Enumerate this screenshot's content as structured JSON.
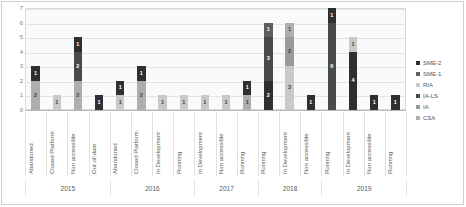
{
  "chart_data": {
    "type": "bar",
    "stacked": true,
    "title": "",
    "xlabel": "",
    "ylabel": "",
    "ylim": [
      0,
      7
    ],
    "yticks": [
      0,
      1,
      2,
      3,
      4,
      5,
      6,
      7
    ],
    "grid": true,
    "legend_position": "right",
    "series": [
      {
        "name": "SME-2",
        "color": "#2f2f2f"
      },
      {
        "name": "SME-1",
        "color": "#5e5e5e"
      },
      {
        "name": "RIA",
        "color": "#c9c9c9"
      },
      {
        "name": "IA-LS",
        "color": "#4a4a4a"
      },
      {
        "name": "IA",
        "color": "#9a9a9a"
      },
      {
        "name": "CSA",
        "color": "#aeaeae"
      }
    ],
    "groups": [
      {
        "year": "2015",
        "categories": [
          {
            "label": "Abandoned",
            "segments": [
              {
                "series": "CSA",
                "value": 2
              },
              {
                "series": "SME-2",
                "value": 1
              }
            ]
          },
          {
            "label": "Closed Platform",
            "segments": [
              {
                "series": "RIA",
                "value": 1
              }
            ]
          },
          {
            "label": "Non accessible",
            "segments": [
              {
                "series": "CSA",
                "value": 2
              },
              {
                "series": "IA-LS",
                "value": 2
              },
              {
                "series": "SME-2",
                "value": 1
              }
            ]
          },
          {
            "label": "Out-of-date",
            "segments": [
              {
                "series": "SME-2",
                "value": 1
              }
            ]
          }
        ]
      },
      {
        "year": "2016",
        "categories": [
          {
            "label": "Abandoned",
            "segments": [
              {
                "series": "RIA",
                "value": 1
              },
              {
                "series": "SME-2",
                "value": 1
              }
            ]
          },
          {
            "label": "Closed Platform",
            "segments": [
              {
                "series": "CSA",
                "value": 2
              },
              {
                "series": "SME-2",
                "value": 1
              }
            ]
          },
          {
            "label": "In Development",
            "segments": [
              {
                "series": "RIA",
                "value": 1
              }
            ]
          },
          {
            "label": "Running",
            "segments": [
              {
                "series": "RIA",
                "value": 1
              }
            ]
          }
        ]
      },
      {
        "year": "2017",
        "categories": [
          {
            "label": "In Development",
            "segments": [
              {
                "series": "RIA",
                "value": 1
              }
            ]
          },
          {
            "label": "Non accessible",
            "segments": [
              {
                "series": "RIA",
                "value": 1
              }
            ]
          },
          {
            "label": "Running",
            "segments": [
              {
                "series": "CSA",
                "value": 1
              },
              {
                "series": "SME-2",
                "value": 1
              }
            ]
          }
        ]
      },
      {
        "year": "2018",
        "categories": [
          {
            "label": "Running",
            "segments": [
              {
                "series": "SME-2",
                "value": 2
              },
              {
                "series": "IA-LS",
                "value": 3
              },
              {
                "series": "SME-1",
                "value": 1
              }
            ]
          },
          {
            "label": "In Development",
            "segments": [
              {
                "series": "RIA",
                "value": 3
              },
              {
                "series": "IA",
                "value": 2
              },
              {
                "series": "CSA",
                "value": 1
              }
            ]
          },
          {
            "label": "Non accessible",
            "segments": [
              {
                "series": "SME-2",
                "value": 1
              }
            ]
          }
        ]
      },
      {
        "year": "2019",
        "categories": [
          {
            "label": "Running",
            "segments": [
              {
                "series": "IA-LS",
                "value": 6
              },
              {
                "series": "SME-2",
                "value": 1
              }
            ]
          },
          {
            "label": "In Development",
            "segments": [
              {
                "series": "SME-2",
                "value": 4
              },
              {
                "series": "RIA",
                "value": 1
              }
            ]
          },
          {
            "label": "Non accessible",
            "segments": [
              {
                "series": "SME-2",
                "value": 1
              }
            ]
          },
          {
            "label": "Running",
            "segments": [
              {
                "series": "SME-2",
                "value": 1
              }
            ]
          }
        ]
      }
    ]
  }
}
